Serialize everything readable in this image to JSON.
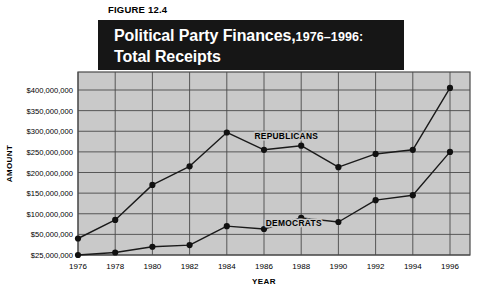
{
  "figure": {
    "caption": "FIGURE 12.4",
    "title_main": "Political Party Finances,",
    "title_years": "1976–1996:",
    "title_line2": "Total Receipts"
  },
  "chart_data": {
    "type": "line",
    "xlabel": "YEAR",
    "ylabel": "AMOUNT",
    "x": [
      1976,
      1978,
      1980,
      1982,
      1984,
      1986,
      1988,
      1990,
      1992,
      1994,
      1996
    ],
    "xtick_labels": [
      "1976",
      "1978",
      "1980",
      "1982",
      "1984",
      "1986",
      "1988",
      "1990",
      "1992",
      "1994",
      "1996"
    ],
    "ytick_values": [
      25000000,
      50000000,
      100000000,
      150000000,
      200000000,
      250000000,
      300000000,
      350000000,
      400000000
    ],
    "ytick_labels": [
      "$25,000,000",
      "$50,000,000",
      "$100,000,000",
      "$150,000,000",
      "$200,000,000",
      "$250,000,000",
      "$300,000,000",
      "$350,000,000",
      "$400,000,000"
    ],
    "ylim": [
      25000000,
      425000000
    ],
    "xlim": [
      1976,
      1996
    ],
    "grid": true,
    "legend_position": "inline",
    "series": [
      {
        "name": "REPUBLICANS",
        "label_x": 1987.2,
        "label_y": 282000000,
        "values": [
          45000000,
          85000000,
          170000000,
          215000000,
          297000000,
          255000000,
          265000000,
          213000000,
          245000000,
          255000000,
          405000000
        ]
      },
      {
        "name": "DEMOCRATS",
        "label_x": 1987.6,
        "label_y": 70000000,
        "values": [
          25000000,
          28000000,
          35000000,
          37000000,
          70000000,
          63000000,
          90000000,
          80000000,
          133000000,
          145000000,
          250000000
        ]
      }
    ]
  },
  "colors": {
    "banner_bg": "#161616",
    "banner_text": "#ffffff",
    "plot_bg": "#c9c9c9",
    "grid": "#4a4a4a",
    "line": "#1a1a1a",
    "marker": "#111111",
    "page_bg": "#ffffff"
  }
}
